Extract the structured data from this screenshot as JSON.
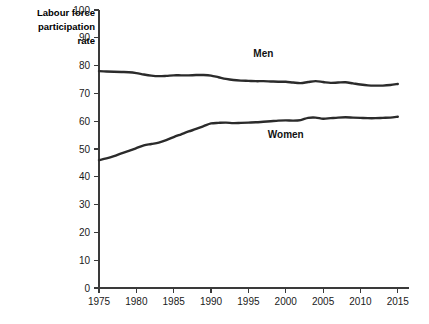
{
  "chart_data": {
    "type": "line",
    "title": "",
    "xlabel": "",
    "ylabel": "Labour force participation rate",
    "ylabel_lines": [
      "Labour force",
      "participation",
      "rate"
    ],
    "xlim": [
      1975,
      2015
    ],
    "ylim": [
      0,
      100
    ],
    "yticks": [
      0,
      10,
      20,
      30,
      40,
      50,
      60,
      70,
      80,
      90,
      100
    ],
    "xticks": [
      1975,
      1980,
      1985,
      1990,
      1995,
      2000,
      2005,
      2010,
      2015
    ],
    "ytick_labels": [
      "0",
      "10",
      "20",
      "30",
      "40",
      "50",
      "60",
      "70",
      "80",
      "90",
      "100"
    ],
    "xtick_labels": [
      "1975",
      "1980",
      "1985",
      "1990",
      "1995",
      "2000",
      "2005",
      "2010",
      "2015"
    ],
    "grid": false,
    "legend": "inline-labels",
    "line_color": "#2b2b2b",
    "axis_color": "#3a3a3a",
    "background": "#ffffff",
    "series": [
      {
        "name": "Men",
        "label": "Men",
        "label_x": 1997,
        "label_y": 83,
        "x": [
          1975,
          1976,
          1977,
          1978,
          1979,
          1980,
          1981,
          1982,
          1983,
          1984,
          1985,
          1986,
          1987,
          1988,
          1989,
          1990,
          1991,
          1992,
          1993,
          1994,
          1995,
          1996,
          1997,
          1998,
          1999,
          2000,
          2001,
          2002,
          2003,
          2004,
          2005,
          2006,
          2007,
          2008,
          2009,
          2010,
          2011,
          2012,
          2013,
          2014,
          2015
        ],
        "values": [
          78.0,
          77.9,
          77.8,
          77.7,
          77.6,
          77.3,
          76.8,
          76.4,
          76.2,
          76.3,
          76.5,
          76.5,
          76.5,
          76.6,
          76.6,
          76.4,
          75.8,
          75.2,
          74.8,
          74.6,
          74.5,
          74.4,
          74.4,
          74.3,
          74.2,
          74.2,
          73.9,
          73.7,
          74.1,
          74.4,
          74.1,
          73.8,
          73.9,
          74.0,
          73.6,
          73.2,
          72.9,
          72.8,
          72.8,
          73.0,
          73.4
        ]
      },
      {
        "name": "Women",
        "label": "Women",
        "label_x": 2000,
        "label_y": 54,
        "x": [
          1975,
          1976,
          1977,
          1978,
          1979,
          1980,
          1981,
          1982,
          1983,
          1984,
          1985,
          1986,
          1987,
          1988,
          1989,
          1990,
          1991,
          1992,
          1993,
          1994,
          1995,
          1996,
          1997,
          1998,
          1999,
          2000,
          2001,
          2002,
          2003,
          2004,
          2005,
          2006,
          2007,
          2008,
          2009,
          2010,
          2011,
          2012,
          2013,
          2014,
          2015
        ],
        "values": [
          46.0,
          46.6,
          47.4,
          48.4,
          49.3,
          50.3,
          51.3,
          51.8,
          52.3,
          53.2,
          54.3,
          55.3,
          56.3,
          57.2,
          58.2,
          59.2,
          59.4,
          59.5,
          59.3,
          59.4,
          59.5,
          59.6,
          59.8,
          60.0,
          60.2,
          60.3,
          60.2,
          60.4,
          61.2,
          61.3,
          60.9,
          61.1,
          61.3,
          61.4,
          61.3,
          61.2,
          61.1,
          61.1,
          61.2,
          61.3,
          61.6
        ]
      }
    ]
  }
}
